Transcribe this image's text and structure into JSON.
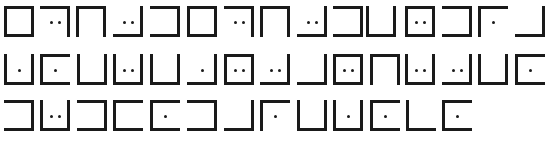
{
  "ink_color": "#1a1a1a",
  "background": "#ffffff",
  "glyph_size": {
    "w": 30,
    "h": 31
  },
  "stroke": 3,
  "legend": {
    "T": "top edge",
    "B": "bottom edge",
    "L": "left edge",
    "R": "right edge",
    "dots": "number of dots inside glyph"
  },
  "rows": [
    {
      "y": 6,
      "glyphs": [
        {
          "x": 4,
          "edges": "TBLR",
          "dots": 0
        },
        {
          "x": 40,
          "edges": "TR",
          "dots": 2
        },
        {
          "x": 76,
          "edges": "TLR",
          "dots": 0
        },
        {
          "x": 113,
          "edges": "BR",
          "dots": 2
        },
        {
          "x": 150,
          "edges": "TBR",
          "dots": 0
        },
        {
          "x": 187,
          "edges": "TBLR",
          "dots": 0
        },
        {
          "x": 224,
          "edges": "TR",
          "dots": 2
        },
        {
          "x": 260,
          "edges": "TLR",
          "dots": 0
        },
        {
          "x": 297,
          "edges": "BR",
          "dots": 2
        },
        {
          "x": 333,
          "edges": "TBR",
          "dots": 0
        },
        {
          "x": 366,
          "edges": "LBR",
          "dots": 0
        },
        {
          "x": 405,
          "edges": "TBLR",
          "dots": 2
        },
        {
          "x": 442,
          "edges": "TBR",
          "dots": 0
        },
        {
          "x": 478,
          "edges": "TL",
          "dots": 1
        },
        {
          "x": 515,
          "edges": "BR",
          "dots": 0
        }
      ]
    },
    {
      "y": 54,
      "glyphs": [
        {
          "x": 4,
          "edges": "LBR",
          "dots": 1
        },
        {
          "x": 40,
          "edges": "TBL",
          "dots": 1
        },
        {
          "x": 77,
          "edges": "LBR",
          "dots": 0
        },
        {
          "x": 113,
          "edges": "LBR",
          "dots": 2
        },
        {
          "x": 150,
          "edges": "LBR",
          "dots": 0
        },
        {
          "x": 187,
          "edges": "BR",
          "dots": 1
        },
        {
          "x": 224,
          "edges": "TBLR",
          "dots": 2
        },
        {
          "x": 260,
          "edges": "BR",
          "dots": 2
        },
        {
          "x": 297,
          "edges": "BR",
          "dots": 0
        },
        {
          "x": 333,
          "edges": "TBLR",
          "dots": 2
        },
        {
          "x": 370,
          "edges": "TLR",
          "dots": 0
        },
        {
          "x": 405,
          "edges": "LBR",
          "dots": 2
        },
        {
          "x": 442,
          "edges": "BR",
          "dots": 2
        },
        {
          "x": 478,
          "edges": "LBR",
          "dots": 0
        },
        {
          "x": 515,
          "edges": "TBL",
          "dots": 1
        }
      ]
    },
    {
      "y": 100,
      "glyphs": [
        {
          "x": 4,
          "edges": "TBR",
          "dots": 0
        },
        {
          "x": 40,
          "edges": "LBR",
          "dots": 2
        },
        {
          "x": 77,
          "edges": "TBR",
          "dots": 0
        },
        {
          "x": 113,
          "edges": "TBL",
          "dots": 0
        },
        {
          "x": 150,
          "edges": "TBL",
          "dots": 1
        },
        {
          "x": 187,
          "edges": "TBR",
          "dots": 0
        },
        {
          "x": 224,
          "edges": "BR",
          "dots": 0
        },
        {
          "x": 260,
          "edges": "TL",
          "dots": 1
        },
        {
          "x": 297,
          "edges": "LBR",
          "dots": 0
        },
        {
          "x": 333,
          "edges": "LBR",
          "dots": 1
        },
        {
          "x": 370,
          "edges": "TBL",
          "dots": 1
        },
        {
          "x": 406,
          "edges": "LB",
          "dots": 0
        },
        {
          "x": 442,
          "edges": "TBL",
          "dots": 1
        }
      ]
    }
  ]
}
